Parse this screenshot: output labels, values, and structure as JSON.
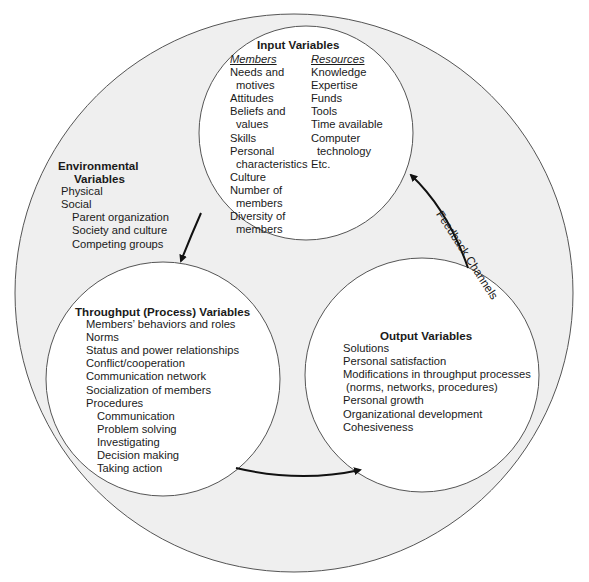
{
  "diagram": {
    "outer_label": {
      "title_line1": "Environmental",
      "title_line2": "Variables",
      "items": [
        {
          "text": "Physical",
          "indent": 0
        },
        {
          "text": "Social",
          "indent": 0
        },
        {
          "text": "Parent organization",
          "indent": 1
        },
        {
          "text": "Society and culture",
          "indent": 1
        },
        {
          "text": "Competing groups",
          "indent": 1
        }
      ]
    },
    "input": {
      "title": "Input Variables",
      "members_header": "Members",
      "resources_header": "Resources",
      "members": [
        "Needs and",
        "motives",
        "Attitudes",
        "Beliefs and",
        "values",
        "Skills",
        "Personal",
        "characteristics",
        "Culture",
        "Number of",
        "members",
        "Diversity of",
        "members"
      ],
      "resources": [
        "Knowledge",
        "Expertise",
        "Funds",
        "Tools",
        "Time available",
        "Computer",
        "technology",
        "Etc."
      ]
    },
    "throughput": {
      "title": "Throughput (Process) Variables",
      "items": [
        "Members’ behaviors and roles",
        "Norms",
        "Status and power relationships",
        "Conflict/cooperation",
        "Communication network",
        "Socialization of members",
        "Procedures"
      ],
      "procedures": [
        "Communication",
        "Problem solving",
        "Investigating",
        "Decision making",
        "Taking action"
      ]
    },
    "output": {
      "title": "Output Variables",
      "items": [
        "Solutions",
        "Personal satisfaction",
        "Modifications in throughput processes",
        "(norms, networks, procedures)",
        "Personal growth",
        "Organizational development",
        "Cohesiveness"
      ]
    },
    "feedback_label": "Feedback Channels",
    "colors": {
      "outer_fill": "#efefef",
      "inner_fill": "#ffffff",
      "stroke": "#555555",
      "arrow": "#111111"
    }
  }
}
